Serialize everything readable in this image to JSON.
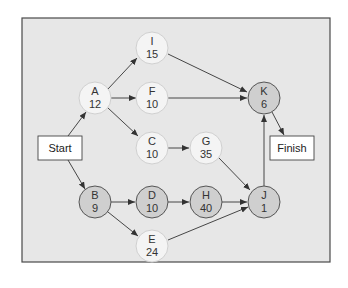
{
  "diagram": {
    "type": "network-activity-diagram",
    "colors": {
      "panel_fill": "#e7e7e7",
      "panel_border": "#4a4a4a",
      "light_node_fill": "#f4f4f4",
      "light_node_stroke": "#d0d0d0",
      "critical_node_fill": "#cfcfcf",
      "critical_node_stroke": "#555555",
      "edge": "#333333",
      "box_fill": "#ffffff",
      "box_stroke": "#444444"
    },
    "start": {
      "label": "Start"
    },
    "finish": {
      "label": "Finish"
    },
    "nodes": [
      {
        "id": "I",
        "letter": "I",
        "value": "15",
        "critical": false
      },
      {
        "id": "A",
        "letter": "A",
        "value": "12",
        "critical": false
      },
      {
        "id": "F",
        "letter": "F",
        "value": "10",
        "critical": false
      },
      {
        "id": "C",
        "letter": "C",
        "value": "10",
        "critical": false
      },
      {
        "id": "G",
        "letter": "G",
        "value": "35",
        "critical": false
      },
      {
        "id": "K",
        "letter": "K",
        "value": "6",
        "critical": true
      },
      {
        "id": "B",
        "letter": "B",
        "value": "9",
        "critical": true
      },
      {
        "id": "D",
        "letter": "D",
        "value": "10",
        "critical": true
      },
      {
        "id": "H",
        "letter": "H",
        "value": "40",
        "critical": true
      },
      {
        "id": "J",
        "letter": "J",
        "value": "1",
        "critical": true
      },
      {
        "id": "E",
        "letter": "E",
        "value": "24",
        "critical": false
      }
    ],
    "edges": [
      [
        "Start",
        "A"
      ],
      [
        "Start",
        "B"
      ],
      [
        "A",
        "I"
      ],
      [
        "A",
        "F"
      ],
      [
        "A",
        "C"
      ],
      [
        "I",
        "K"
      ],
      [
        "F",
        "K"
      ],
      [
        "C",
        "G"
      ],
      [
        "G",
        "J"
      ],
      [
        "B",
        "D"
      ],
      [
        "B",
        "E"
      ],
      [
        "D",
        "H"
      ],
      [
        "H",
        "J"
      ],
      [
        "E",
        "J"
      ],
      [
        "J",
        "K"
      ],
      [
        "K",
        "Finish"
      ]
    ]
  }
}
